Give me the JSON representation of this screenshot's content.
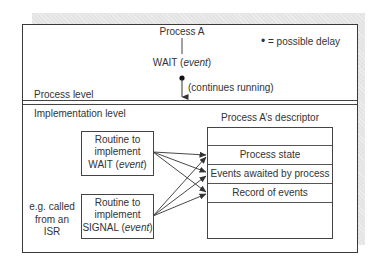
{
  "diagram": {
    "process_title": "Process A",
    "wait_call": {
      "name": "WAIT",
      "arg": "event"
    },
    "continues_label": "(continues running)",
    "legend": {
      "symbol": "•",
      "text": "= possible delay"
    },
    "levels": {
      "process_level": "Process level",
      "implementation_level": "Implementation level"
    },
    "routines": [
      {
        "line1": "Routine to",
        "line2": "implement",
        "line3_name": "WAIT",
        "line3_arg": "event"
      },
      {
        "line1": "Routine to",
        "line2": "implement",
        "line3_name": "SIGNAL",
        "line3_arg": "event"
      }
    ],
    "isr_note": {
      "line1": "e.g. called",
      "line2": "from an",
      "line3": "ISR"
    },
    "descriptor": {
      "title": "Process A’s descriptor",
      "rows": [
        "",
        "Process state",
        "Events awaited by process",
        "Record of events",
        ""
      ]
    },
    "arrows": [
      {
        "from": "routine-wait",
        "to": "process-state"
      },
      {
        "from": "routine-wait",
        "to": "events-awaited"
      },
      {
        "from": "routine-wait",
        "to": "record-of-events"
      },
      {
        "from": "routine-signal",
        "to": "process-state"
      },
      {
        "from": "routine-signal",
        "to": "events-awaited"
      },
      {
        "from": "routine-signal",
        "to": "record-of-events"
      }
    ]
  }
}
